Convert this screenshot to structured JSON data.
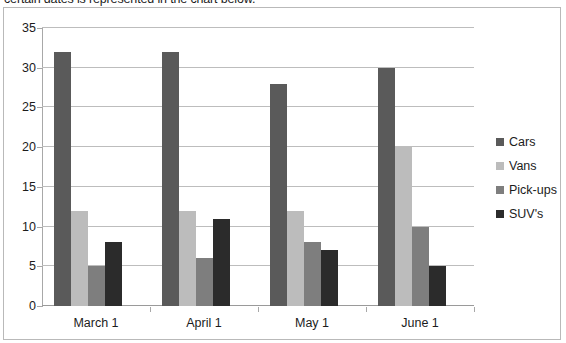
{
  "intro": {
    "text": "certain dates is represented in the chart below."
  },
  "chart_data": {
    "type": "bar",
    "title": "",
    "xlabel": "",
    "ylabel": "",
    "ylim": [
      0,
      35
    ],
    "ytick_step": 5,
    "yticks": [
      0,
      5,
      10,
      15,
      20,
      25,
      30,
      35
    ],
    "grid": true,
    "legend_position": "right",
    "categories": [
      "March 1",
      "April 1",
      "May 1",
      "June 1"
    ],
    "series": [
      {
        "name": "Cars",
        "color": "#5a5a5a",
        "values": [
          32,
          32,
          28,
          30
        ]
      },
      {
        "name": "Vans",
        "color": "#bcbcbc",
        "values": [
          12,
          12,
          12,
          20
        ]
      },
      {
        "name": "Pick-ups",
        "color": "#7e7e7e",
        "values": [
          5,
          6,
          8,
          10
        ]
      },
      {
        "name": "SUV's",
        "color": "#2b2b2b",
        "values": [
          8,
          11,
          7,
          5
        ]
      }
    ]
  },
  "colors": {
    "gridline": "#bdbdbd",
    "axis": "#a8a8a8",
    "frame_border": "#b9b9b9",
    "text": "#1c1c1c",
    "background": "#ffffff"
  }
}
